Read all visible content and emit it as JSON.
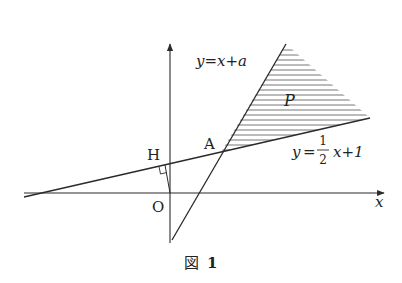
{
  "figure": {
    "caption_prefix": "図",
    "caption_number": "1",
    "labels": {
      "line1_y": "y",
      "line1_eq": "=",
      "line1_rhs": "x+a",
      "line2_y": "y",
      "line2_eq": "=",
      "line2_num": "1",
      "line2_den": "2",
      "line2_rhs": "x+1",
      "region": "P",
      "point_A": "A",
      "point_H": "H",
      "origin": "O",
      "x_axis": "x"
    },
    "colors": {
      "line": "#2a2a2a",
      "hatch": "#555555",
      "background": "#ffffff"
    }
  }
}
